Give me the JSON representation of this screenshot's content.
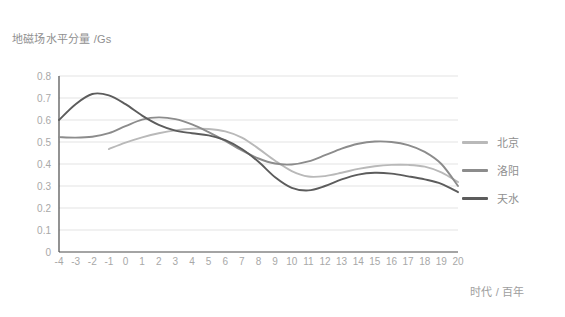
{
  "chart_data": {
    "type": "line",
    "title": "",
    "ylabel": "地磁场水平分量 /Gs",
    "xlabel": "时代 / 百年",
    "xlim": [
      -4,
      20
    ],
    "ylim": [
      0,
      0.8
    ],
    "grid": true,
    "legend_position": "right",
    "x_ticks": [
      "-4",
      "-3",
      "-2",
      "-1",
      "0",
      "1",
      "2",
      "3",
      "4",
      "5",
      "6",
      "7",
      "8",
      "9",
      "10",
      "11",
      "12",
      "13",
      "14",
      "15",
      "16",
      "17",
      "18",
      "19",
      "20"
    ],
    "y_ticks": [
      "0",
      "0.1",
      "0.2",
      "0.3",
      "0.4",
      "0.5",
      "0.6",
      "0.7",
      "0.8"
    ],
    "series": [
      {
        "name": "北京",
        "color": "#b9b9b9",
        "x": [
          -1,
          0,
          1,
          2,
          3,
          4,
          5,
          6,
          7,
          8,
          9,
          10,
          11,
          12,
          13,
          14,
          15,
          16,
          17,
          18,
          19,
          20
        ],
        "values": [
          0.468,
          0.497,
          0.521,
          0.54,
          0.553,
          0.56,
          0.559,
          0.548,
          0.52,
          0.47,
          0.415,
          0.368,
          0.343,
          0.345,
          0.36,
          0.378,
          0.39,
          0.396,
          0.396,
          0.388,
          0.362,
          0.318
        ]
      },
      {
        "name": "洛阳",
        "color": "#8c8c8c",
        "x": [
          -4,
          -3,
          -2,
          -1,
          0,
          1,
          2,
          3,
          4,
          5,
          6,
          7,
          8,
          9,
          10,
          11,
          12,
          13,
          14,
          15,
          16,
          17,
          18,
          19,
          20
        ],
        "values": [
          0.522,
          0.52,
          0.524,
          0.54,
          0.572,
          0.602,
          0.612,
          0.604,
          0.58,
          0.545,
          0.505,
          0.462,
          0.425,
          0.402,
          0.398,
          0.412,
          0.44,
          0.47,
          0.492,
          0.502,
          0.5,
          0.486,
          0.455,
          0.4,
          0.3
        ]
      },
      {
        "name": "天水",
        "color": "#5c5c5c",
        "x": [
          -4,
          -3,
          -2,
          -1,
          0,
          1,
          2,
          3,
          4,
          5,
          6,
          7,
          8,
          9,
          10,
          11,
          12,
          13,
          14,
          15,
          16,
          17,
          18,
          19,
          20
        ],
        "values": [
          0.6,
          0.672,
          0.718,
          0.712,
          0.672,
          0.62,
          0.578,
          0.552,
          0.54,
          0.53,
          0.508,
          0.468,
          0.41,
          0.34,
          0.292,
          0.28,
          0.3,
          0.33,
          0.352,
          0.36,
          0.356,
          0.344,
          0.33,
          0.31,
          0.272
        ]
      }
    ]
  },
  "legend": {
    "items": [
      {
        "label": "北京",
        "color": "#b9b9b9"
      },
      {
        "label": "洛阳",
        "color": "#8c8c8c"
      },
      {
        "label": "天水",
        "color": "#5c5c5c"
      }
    ]
  }
}
